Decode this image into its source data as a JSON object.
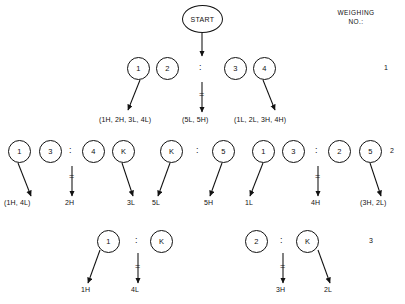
{
  "header": {
    "title": "WEIGHING\nNO.:"
  },
  "start": {
    "label": "START"
  },
  "weighing_numbers": [
    {
      "value": "1"
    },
    {
      "value": "2"
    },
    {
      "value": "3"
    }
  ],
  "operators": {
    "colon": ":",
    "equals": "="
  },
  "rows": [
    {
      "id": "weighing-1",
      "weighing_no": "1",
      "left_group": [
        "1",
        "2"
      ],
      "right_group": [
        "3",
        "4"
      ],
      "outcomes": {
        "left": "(1H, 2H, 3L, 4L)",
        "balance": "(5L, 5H)",
        "right": "(1L, 2L, 3H, 4H)"
      }
    },
    {
      "id": "weighing-2",
      "weighing_no": "2",
      "comparisons": [
        {
          "left_group": [
            "1",
            "3"
          ],
          "right_group": [
            "4",
            "K"
          ],
          "outcomes": {
            "left": "(1H, 4L)",
            "balance": "2H",
            "right": "3L"
          }
        },
        {
          "left_group": [
            "K"
          ],
          "right_group": [
            "5"
          ],
          "outcomes": {
            "left": "5L",
            "right": "5H"
          }
        },
        {
          "left_group": [
            "1",
            "3"
          ],
          "right_group": [
            "2",
            "5"
          ],
          "outcomes": {
            "left": "1L",
            "balance": "4H",
            "right": "(3H, 2L)"
          }
        }
      ]
    },
    {
      "id": "weighing-3",
      "weighing_no": "3",
      "comparisons": [
        {
          "left_group": [
            "1"
          ],
          "right_group": [
            "K"
          ],
          "outcomes": {
            "left": "1H",
            "balance": "4L"
          }
        },
        {
          "left_group": [
            "2"
          ],
          "right_group": [
            "K"
          ],
          "outcomes": {
            "balance": "3H",
            "right": "2L"
          }
        }
      ]
    }
  ],
  "nodes": {
    "r2_n1": "1",
    "r2_n2": "2",
    "r2_n3": "3",
    "r2_n4": "4",
    "r3_n1": "1",
    "r3_n2": "3",
    "r3_n3": "4",
    "r3_n4": "K",
    "r3_n5": "K",
    "r3_n6": "5",
    "r3_n7": "1",
    "r3_n8": "3",
    "r3_n9": "2",
    "r3_n10": "5",
    "r4_n1": "1",
    "r4_n2": "K",
    "r4_n3": "2",
    "r4_n4": "K"
  },
  "labels": {
    "r2_left": "(1H, 2H, 3L, 4L)",
    "r2_mid": "(5L, 5H)",
    "r2_right": "(1L, 2L, 3H, 4H)",
    "r3_a": "(1H, 4L)",
    "r3_b": "2H",
    "r3_c": "3L",
    "r3_d": "5L",
    "r3_e": "5H",
    "r3_f": "1L",
    "r3_g": "4H",
    "r3_h": "(3H, 2L)",
    "r4_a": "1H",
    "r4_b": "4L",
    "r4_c": "3H",
    "r4_d": "2L"
  },
  "colors": {
    "ink": "#111111",
    "background": "#ffffff"
  }
}
